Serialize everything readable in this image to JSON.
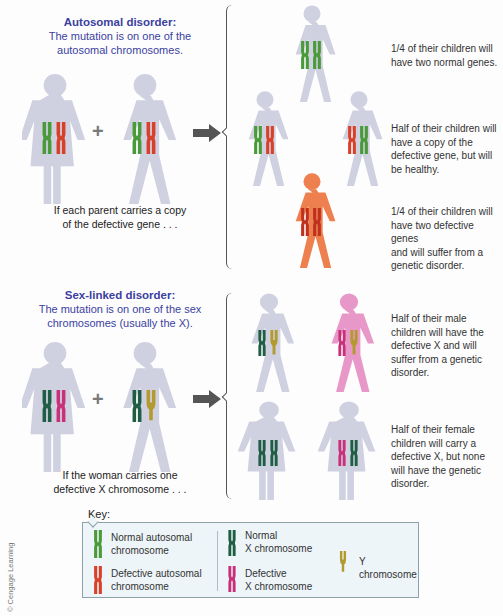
{
  "autosomal": {
    "title": "Autosomal disorder:",
    "subtitle_line1": "The mutation is on one of the",
    "subtitle_line2": "autosomal chromosomes.",
    "plus": "+",
    "caption_line1": "If each parent carries a copy",
    "caption_line2": "of the defective gene . . .",
    "outcomes": [
      {
        "text_lines": [
          "1/4 of their children will",
          "have two normal genes."
        ]
      },
      {
        "text_lines": [
          "Half of their children will",
          "have a copy of the",
          "defective gene, but will",
          "be healthy."
        ]
      },
      {
        "text_lines": [
          "1/4 of their children will",
          "have two defective genes",
          "and will suffer from a",
          "genetic disorder."
        ]
      }
    ]
  },
  "sexlinked": {
    "title": "Sex-linked disorder:",
    "subtitle_line1": "The mutation is on one of the sex",
    "subtitle_line2": "chromosomes (usually the X).",
    "plus": "+",
    "caption_line1": "If the woman carries one",
    "caption_line2": "defective X chromosome . . .",
    "outcomes": [
      {
        "text_lines": [
          "Half of their male",
          "children will have the",
          "defective X and will",
          "suffer from a genetic",
          "disorder."
        ]
      },
      {
        "text_lines": [
          "Half of their female",
          "children will carry a",
          "defective X, but none",
          "will have the genetic",
          "disorder."
        ]
      }
    ]
  },
  "key": {
    "title": "Key:",
    "items": [
      {
        "line1": "Normal autosomal",
        "line2": "chromosome",
        "color": "#4a9a3a"
      },
      {
        "line1": "Defective autosomal",
        "line2": "chromosome",
        "color": "#d8402a"
      },
      {
        "line1": "Normal",
        "line2": "X chromosome",
        "color": "#1f5e45"
      },
      {
        "line1": "Defective",
        "line2": "X chromosome",
        "color": "#c8307a"
      },
      {
        "line1": "Y chromosome",
        "line2": "",
        "color": "#b39a2e"
      }
    ]
  },
  "credit": "© Cengage Learning",
  "colors": {
    "figure_gray": "#cfd0e0",
    "figure_orange": "#ee8050",
    "figure_pink": "#e898c8",
    "title_blue": "#3b3fa0",
    "arrow": "#555555"
  }
}
